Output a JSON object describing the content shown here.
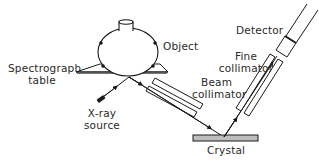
{
  "diagram": {
    "labels": {
      "object": "Object",
      "spectrograph_table_line1": "Spectrograph",
      "spectrograph_table_line2": "table",
      "xray_source_line1": "X-ray",
      "xray_source_line2": "source",
      "beam_collimator_line1": "Beam",
      "beam_collimator_line2": "collimator",
      "fine_collimator_line1": "Fine",
      "fine_collimator_line2": "collimator",
      "detector": "Detector",
      "crystal": "Crystal"
    },
    "colors": {
      "line": "#1a1a1a",
      "crystal_fill": "#bdbdbd",
      "text": "#2a2a2a"
    }
  }
}
